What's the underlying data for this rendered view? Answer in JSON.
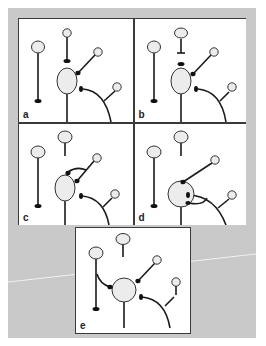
{
  "figure": {
    "panels": [
      {
        "id": "a",
        "label": "a"
      },
      {
        "id": "b",
        "label": "b"
      },
      {
        "id": "c",
        "label": "c"
      },
      {
        "id": "d",
        "label": "d"
      },
      {
        "id": "e",
        "label": "e"
      }
    ]
  },
  "colors": {
    "background": "#c9c9c9",
    "stroke": "#1a1a1a",
    "cell_fill": "#ececec",
    "border": "#3a3a3a"
  }
}
